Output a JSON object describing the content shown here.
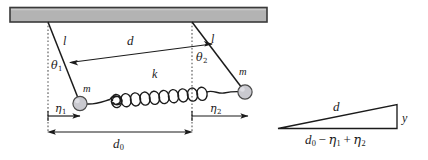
{
  "figure": {
    "colors": {
      "line": "#1b1b1b",
      "ceiling_fill": "#b3b3b3",
      "ceiling_stroke": "#3a3a3a",
      "mass_fill": "#c9c9cf",
      "mass_stroke": "#4a4a4a",
      "dotted": "#6b6b6b",
      "background": "#ffffff"
    }
  },
  "main_diagram": {
    "ceiling": {
      "name": "support-bar"
    },
    "rods": [
      {
        "label": "l",
        "side": "left"
      },
      {
        "label": "l",
        "side": "right"
      }
    ],
    "angles": [
      {
        "symbol": "θ",
        "subscript": "1"
      },
      {
        "symbol": "θ",
        "subscript": "2"
      }
    ],
    "masses": [
      {
        "label": "m",
        "side": "left"
      },
      {
        "label": "m",
        "side": "right"
      }
    ],
    "spring": {
      "label": "k"
    },
    "displacements": [
      {
        "symbol": "η",
        "subscript": "1"
      },
      {
        "symbol": "η",
        "subscript": "2"
      }
    ],
    "separation": {
      "label": "d"
    },
    "rest_separation": {
      "symbol": "d",
      "subscript": "0"
    }
  },
  "triangle_inset": {
    "hypotenuse_label": "d",
    "vertical_label": "y",
    "base_label": "d₀ − η₁ + η₂",
    "base_parts": {
      "d": "d",
      "d_sub": "0",
      "minus": "−",
      "eta1": "η",
      "eta1_sub": "1",
      "plus": "+",
      "eta2": "η",
      "eta2_sub": "2"
    }
  }
}
